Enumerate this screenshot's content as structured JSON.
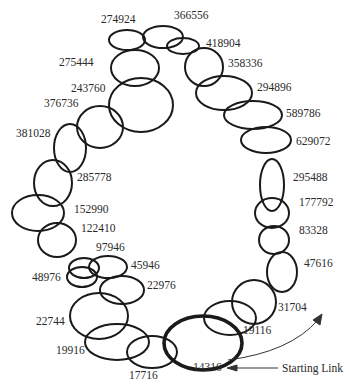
{
  "diagram": {
    "type": "chain-of-links",
    "stroke_color": "#1a1a1a",
    "starting_link_label": "Starting Link",
    "links": [
      {
        "id": "274924",
        "cx": 127,
        "cy": 40,
        "rx": 18,
        "ry": 10,
        "lx": 101,
        "ly": 14
      },
      {
        "id": "366556",
        "cx": 163,
        "cy": 37,
        "rx": 20,
        "ry": 11,
        "lx": 174,
        "ly": 10
      },
      {
        "id": "418904",
        "cx": 183,
        "cy": 46,
        "rx": 16,
        "ry": 8,
        "lx": 206,
        "ly": 38
      },
      {
        "id": "275444",
        "cx": 135,
        "cy": 68,
        "rx": 24,
        "ry": 18,
        "lx": 59,
        "ly": 57
      },
      {
        "id": "358336",
        "cx": 204,
        "cy": 67,
        "rx": 19,
        "ry": 19,
        "lx": 228,
        "ly": 58
      },
      {
        "id": "243760",
        "cx": 141,
        "cy": 105,
        "rx": 32,
        "ry": 27,
        "lx": 71,
        "ly": 83
      },
      {
        "id": "294896",
        "cx": 224,
        "cy": 93,
        "rx": 28,
        "ry": 17,
        "lx": 257,
        "ly": 82
      },
      {
        "id": "376736",
        "cx": 100,
        "cy": 127,
        "rx": 23,
        "ry": 21,
        "lx": 44,
        "ly": 98
      },
      {
        "id": "589786",
        "cx": 253,
        "cy": 115,
        "rx": 29,
        "ry": 14,
        "lx": 286,
        "ly": 108
      },
      {
        "id": "381028",
        "cx": 70,
        "cy": 148,
        "rx": 16,
        "ry": 24,
        "lx": 16,
        "ly": 128
      },
      {
        "id": "629072",
        "cx": 266,
        "cy": 140,
        "rx": 25,
        "ry": 13,
        "lx": 296,
        "ly": 136
      },
      {
        "id": "295488",
        "cx": 272,
        "cy": 185,
        "rx": 12,
        "ry": 26,
        "lx": 293,
        "ly": 172
      },
      {
        "id": "285778",
        "cx": 53,
        "cy": 183,
        "rx": 19,
        "ry": 23,
        "lx": 77,
        "ly": 172
      },
      {
        "id": "177792",
        "cx": 272,
        "cy": 213,
        "rx": 17,
        "ry": 15,
        "lx": 299,
        "ly": 197
      },
      {
        "id": "152990",
        "cx": 38,
        "cy": 213,
        "rx": 26,
        "ry": 18,
        "lx": 74,
        "ly": 204
      },
      {
        "id": "83328",
        "cx": 274,
        "cy": 240,
        "rx": 15,
        "ry": 14,
        "lx": 299,
        "ly": 225
      },
      {
        "id": "122410",
        "cx": 57,
        "cy": 240,
        "rx": 19,
        "ry": 17,
        "lx": 81,
        "ly": 223
      },
      {
        "id": "47616",
        "cx": 282,
        "cy": 272,
        "rx": 15,
        "ry": 20,
        "lx": 304,
        "ly": 258
      },
      {
        "id": "97946",
        "cx": 84,
        "cy": 268,
        "rx": 15,
        "ry": 10,
        "lx": 96,
        "ly": 242
      },
      {
        "id": "45946",
        "cx": 108,
        "cy": 267,
        "rx": 19,
        "ry": 11,
        "lx": 131,
        "ly": 260
      },
      {
        "id": "48976",
        "cx": 82,
        "cy": 277,
        "rx": 15,
        "ry": 10,
        "lx": 32,
        "ly": 272
      },
      {
        "id": "22976",
        "cx": 122,
        "cy": 290,
        "rx": 22,
        "ry": 14,
        "lx": 147,
        "ly": 280
      },
      {
        "id": "31704",
        "cx": 254,
        "cy": 302,
        "rx": 22,
        "ry": 22,
        "lx": 278,
        "ly": 302
      },
      {
        "id": "22744",
        "cx": 99,
        "cy": 316,
        "rx": 29,
        "ry": 23,
        "lx": 36,
        "ly": 316
      },
      {
        "id": "19116",
        "cx": 230,
        "cy": 318,
        "rx": 26,
        "ry": 17,
        "lx": 243,
        "ly": 325
      },
      {
        "id": "19916",
        "cx": 117,
        "cy": 342,
        "rx": 32,
        "ry": 18,
        "lx": 56,
        "ly": 345
      },
      {
        "id": "17716",
        "cx": 152,
        "cy": 352,
        "rx": 25,
        "ry": 16,
        "lx": 129,
        "ly": 370
      },
      {
        "id": "14316",
        "cx": 203,
        "cy": 343,
        "rx": 39,
        "ry": 27,
        "lx": 193,
        "ly": 362,
        "bold": true
      }
    ]
  }
}
